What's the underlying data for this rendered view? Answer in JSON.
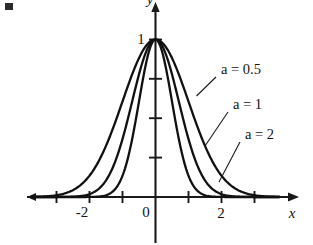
{
  "figure": {
    "name": "gaussian-family-plot",
    "background_color": "#ffffff",
    "ink_color": "#111111"
  },
  "axes": {
    "x_axis_label": "x",
    "y_axis_label": "y",
    "x_tick_labels": [
      "-2",
      "0",
      "2"
    ],
    "y_tick_labels": [
      "1"
    ],
    "x_ticks_shown": [
      -3,
      -2,
      -1,
      0,
      1,
      2,
      3
    ],
    "y_ticks_shown": [
      0.25,
      0.5,
      0.75,
      1
    ],
    "x_label_minus2": "-2",
    "x_label_0": "0",
    "x_label_2": "2",
    "y_label_1": "1"
  },
  "annotations": [
    {
      "name": "label-a-0-5",
      "var": "a",
      "eq": " = ",
      "value": "0.5",
      "text": "a = 0.5"
    },
    {
      "name": "label-a-1",
      "var": "a",
      "eq": " = ",
      "value": "1",
      "text": "a = 1"
    },
    {
      "name": "label-a-2",
      "var": "a",
      "eq": " = ",
      "value": "2",
      "text": "a = 2"
    }
  ],
  "chart_data": {
    "type": "line",
    "title": "",
    "subtitle": "",
    "xlabel": "x",
    "ylabel": "y",
    "xlim": [
      -3.8,
      3.8
    ],
    "ylim": [
      0,
      1.12
    ],
    "grid": false,
    "legend": "inline-annotations",
    "x_ticks": [
      -3,
      -2,
      -1,
      0,
      1,
      2,
      3
    ],
    "x_tick_labels_shown": {
      "-2": "-2",
      "0": "0",
      "2": "2"
    },
    "y_ticks": [
      0.25,
      0.5,
      0.75,
      1
    ],
    "y_tick_labels_shown": {
      "1": "1"
    },
    "function": "y = exp(-a * x^2)",
    "x": [
      -3.6,
      -3.4,
      -3.2,
      -3.0,
      -2.8,
      -2.6,
      -2.4,
      -2.2,
      -2.0,
      -1.8,
      -1.6,
      -1.4,
      -1.2,
      -1.0,
      -0.8,
      -0.6,
      -0.4,
      -0.2,
      0.0,
      0.2,
      0.4,
      0.6,
      0.8,
      1.0,
      1.2,
      1.4,
      1.6,
      1.8,
      2.0,
      2.2,
      2.4,
      2.6,
      2.8,
      3.0,
      3.2,
      3.4,
      3.6
    ],
    "series": [
      {
        "name": "a = 0.5",
        "a": 0.5,
        "values": [
          0.0013,
          0.0031,
          0.0074,
          0.0111,
          0.04,
          0.034,
          0.0561,
          0.0889,
          0.1353,
          0.1979,
          0.278,
          0.3753,
          0.4868,
          0.6065,
          0.7261,
          0.8353,
          0.9231,
          0.9802,
          1.0,
          0.9802,
          0.9231,
          0.8353,
          0.7261,
          0.6065,
          0.4868,
          0.3753,
          0.278,
          0.1979,
          0.1353,
          0.0889,
          0.0561,
          0.034,
          0.0198,
          0.0111,
          0.006,
          0.0031,
          0.0013
        ]
      },
      {
        "name": "a = 1",
        "a": 1,
        "values": [
          0.0,
          0.0,
          0.0,
          0.0001,
          0.0004,
          0.0012,
          0.0032,
          0.0079,
          0.0183,
          0.0392,
          0.0773,
          0.1409,
          0.2369,
          0.3679,
          0.5273,
          0.6977,
          0.8521,
          0.9608,
          1.0,
          0.9608,
          0.8521,
          0.6977,
          0.5273,
          0.3679,
          0.2369,
          0.1409,
          0.0773,
          0.0392,
          0.0183,
          0.0079,
          0.0032,
          0.0012,
          0.0004,
          0.0001,
          0.0,
          0.0,
          0.0
        ]
      },
      {
        "name": "a = 2",
        "a": 2,
        "values": [
          0.0,
          0.0,
          0.0,
          0.0,
          0.0,
          0.0,
          0.0,
          0.0001,
          0.0003,
          0.0015,
          0.006,
          0.0198,
          0.0561,
          0.1353,
          0.278,
          0.4868,
          0.7261,
          0.9231,
          1.0,
          0.9231,
          0.7261,
          0.4868,
          0.278,
          0.1353,
          0.0561,
          0.0198,
          0.006,
          0.0015,
          0.0003,
          0.0001,
          0.0,
          0.0,
          0.0,
          0.0,
          0.0,
          0.0,
          0.0
        ]
      }
    ]
  }
}
